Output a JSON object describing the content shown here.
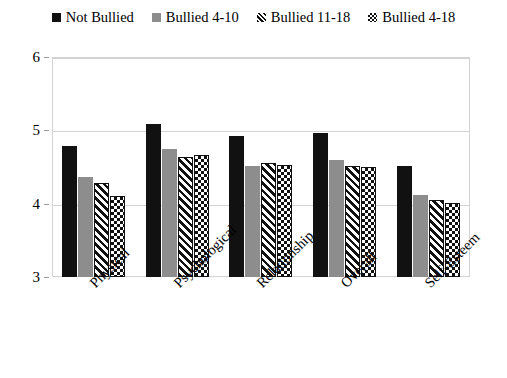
{
  "chart_data": {
    "type": "bar",
    "title": "",
    "xlabel": "",
    "ylabel": "",
    "ylim": [
      3,
      6
    ],
    "yticks": [
      3,
      4,
      5,
      6
    ],
    "grid": true,
    "legend_position": "top-center",
    "categories": [
      "Physical",
      "Psychological",
      "Relationship",
      "Overall",
      "Self-Esteem"
    ],
    "series": [
      {
        "name": "Not Bullied",
        "pattern": "solid-black",
        "color": "#111111",
        "values": [
          4.78,
          5.08,
          4.92,
          4.97,
          4.52
        ]
      },
      {
        "name": "Bullied 4-10",
        "pattern": "solid-gray",
        "color": "#8d8d8d",
        "values": [
          4.36,
          4.74,
          4.51,
          4.6,
          4.12
        ]
      },
      {
        "name": "Bullied 11-18",
        "pattern": "diagonal-stripes",
        "color": "#111111",
        "values": [
          4.28,
          4.64,
          4.55,
          4.52,
          4.05
        ]
      },
      {
        "name": "Bullied 4-18",
        "pattern": "checkerboard",
        "color": "#111111",
        "values": [
          4.1,
          4.66,
          4.53,
          4.5,
          4.01
        ]
      }
    ]
  },
  "legend": {
    "items": [
      {
        "label": "Not Bullied",
        "swatch": "legend-swatch-solid-black"
      },
      {
        "label": "Bullied 4-10",
        "swatch": "legend-swatch-solid-gray"
      },
      {
        "label": "Bullied 11-18",
        "swatch": "legend-swatch-diagonal"
      },
      {
        "label": "Bullied 4-18",
        "swatch": "legend-swatch-checker"
      }
    ]
  },
  "axis": {
    "y_tick_labels": [
      "6",
      "5",
      "4",
      "3"
    ]
  }
}
